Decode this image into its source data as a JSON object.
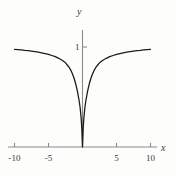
{
  "chart_data": {
    "type": "line",
    "title": "",
    "subtitle": "",
    "xlabel": "x",
    "ylabel": "y",
    "xlim": [
      -11,
      11
    ],
    "ylim": [
      -0.12,
      1.22
    ],
    "grid": false,
    "legend": null,
    "xticks": [
      {
        "value": -10,
        "label": "-10"
      },
      {
        "value": -5,
        "label": "-5"
      },
      {
        "value": 5,
        "label": "5"
      },
      {
        "value": 10,
        "label": "10"
      }
    ],
    "yticks": [
      {
        "value": 1,
        "label": "1"
      }
    ],
    "annotations": [],
    "series": [
      {
        "name": "curve",
        "color": "#1c1c1c",
        "linewidth": 1.3,
        "x": [
          -10,
          -9.5,
          -9,
          -8.5,
          -8,
          -7.5,
          -7,
          -6.5,
          -6,
          -5.5,
          -5,
          -4.5,
          -4,
          -3.5,
          -3,
          -2.5,
          -2,
          -1.75,
          -1.5,
          -1.25,
          -1,
          -0.75,
          -0.5,
          -0.35,
          -0.2,
          -0.1,
          0,
          0.1,
          0.2,
          0.35,
          0.5,
          0.75,
          1,
          1.25,
          1.5,
          1.75,
          2,
          2.5,
          3,
          3.5,
          4,
          4.5,
          5,
          5.5,
          6,
          6.5,
          7,
          7.5,
          8,
          8.5,
          9,
          9.5,
          10
        ],
        "y": [
          0.976,
          0.974,
          0.971,
          0.967,
          0.964,
          0.959,
          0.954,
          0.949,
          0.942,
          0.934,
          0.926,
          0.915,
          0.903,
          0.887,
          0.867,
          0.842,
          0.8,
          0.772,
          0.735,
          0.69,
          0.632,
          0.559,
          0.465,
          0.395,
          0.29,
          0.182,
          0.0,
          0.182,
          0.29,
          0.395,
          0.465,
          0.559,
          0.632,
          0.69,
          0.735,
          0.772,
          0.8,
          0.842,
          0.867,
          0.887,
          0.903,
          0.915,
          0.926,
          0.934,
          0.942,
          0.949,
          0.954,
          0.959,
          0.964,
          0.967,
          0.971,
          0.974,
          0.976
        ]
      }
    ],
    "axes_style": {
      "axis_color": "#8a8a8a",
      "tick_color": "#8a8a8a",
      "text_color": "#3a3a3a",
      "background": "#fdfdfc"
    }
  }
}
